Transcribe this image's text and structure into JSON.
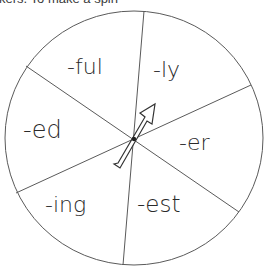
{
  "instruction_text": "kers. To make a spin",
  "spinner": {
    "center": [
      134,
      139
    ],
    "radius": 128,
    "sections": [
      {
        "label": "-ful"
      },
      {
        "label": "-ly"
      },
      {
        "label": "-er"
      },
      {
        "label": "-est"
      },
      {
        "label": "-ing"
      },
      {
        "label": "-ed"
      }
    ],
    "pointer": "arrow-pointer"
  },
  "colors": {
    "stroke": "#555555",
    "text": "#2a2a2a",
    "background": "#ffffff"
  }
}
